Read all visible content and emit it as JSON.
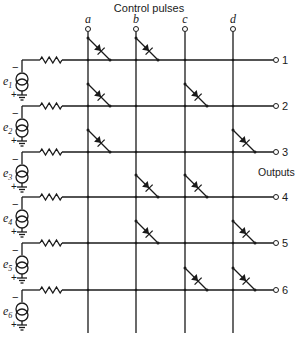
{
  "title": "Control pulses",
  "outputs_label": "Outputs",
  "columns": [
    {
      "label": "a",
      "x": 88
    },
    {
      "label": "b",
      "x": 136
    },
    {
      "label": "c",
      "x": 185
    },
    {
      "label": "d",
      "x": 233
    }
  ],
  "rows": [
    {
      "output": "1",
      "source": "e",
      "sub": "1",
      "y": 60,
      "diodes": [
        "a",
        "b"
      ]
    },
    {
      "output": "2",
      "source": "e",
      "sub": "2",
      "y": 106,
      "diodes": [
        "a",
        "c"
      ]
    },
    {
      "output": "3",
      "source": "e",
      "sub": "3",
      "y": 152,
      "diodes": [
        "a",
        "d"
      ]
    },
    {
      "output": "4",
      "source": "e",
      "sub": "4",
      "y": 197,
      "diodes": [
        "b",
        "c"
      ]
    },
    {
      "output": "5",
      "source": "e",
      "sub": "5",
      "y": 243,
      "diodes": [
        "b",
        "d"
      ]
    },
    {
      "output": "6",
      "source": "e",
      "sub": "6",
      "y": 290,
      "diodes": [
        "c",
        "d"
      ]
    }
  ],
  "polarity": {
    "top": "−",
    "bottom": "+"
  },
  "colors": {
    "ink": "#1a1a1a",
    "background": "#ffffff"
  }
}
